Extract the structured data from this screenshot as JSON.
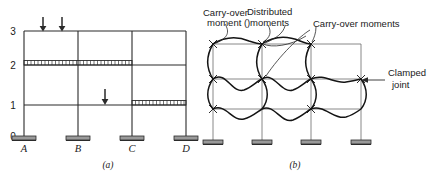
{
  "figure": {
    "type": "structural-engineering-diagram",
    "background": "#ffffff",
    "line_color": "#1a1a1a",
    "panels": [
      {
        "id": "a",
        "caption": "(a)",
        "description": "Loaded multi-story multi-bay rigid frame with fixed bases",
        "level_labels": [
          "3",
          "2",
          "1",
          "0"
        ],
        "column_labels": [
          "A",
          "B",
          "C",
          "D"
        ],
        "point_loads": 3,
        "distributed_loads": 2
      },
      {
        "id": "b",
        "caption": "(b)",
        "description": "Deflected shape of frame showing moment distribution effects",
        "annotations": [
          "Carry-over moment",
          "Distributed moments",
          "Carry-over moments",
          "Clamped joint"
        ]
      }
    ],
    "labels": {
      "carry_over_moment_line1": "Carry-over",
      "carry_over_moment_line2": "moment",
      "distributed_line1": "Distributed",
      "distributed_line2": "moments",
      "carry_over_moments": "Carry-over moments",
      "clamped_line1": "Clamped",
      "clamped_line2": "joint",
      "caption_a": "(a)",
      "caption_b": "(b)",
      "level_3": "3",
      "level_2": "2",
      "level_1": "1",
      "level_0": "0",
      "col_a": "A",
      "col_b": "B",
      "col_c": "C",
      "col_d": "D",
      "paren_open_1": ")",
      "paren_open_2": "("
    }
  }
}
